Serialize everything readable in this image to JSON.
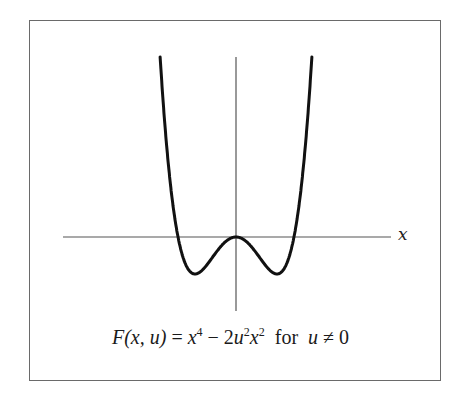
{
  "figure": {
    "axis_label_x": "x",
    "caption": {
      "lhs": "F(x, u)",
      "eq": " = ",
      "rhs_term1_base": "x",
      "rhs_term1_exp": "4",
      "minus": " − 2",
      "rhs_term2_base_u": "u",
      "rhs_term2_exp_u": "2",
      "rhs_term2_base_x": "x",
      "rhs_term2_exp_x": "2",
      "condition_word": "  for  ",
      "condition_var": "u",
      "condition_rel": " ≠ 0",
      "full_text": "F(x, u) = x⁴ − 2u²x²  for  u ≠ 0"
    },
    "colors": {
      "curve": "#111111",
      "axes": "#555555",
      "frame": "#6a6a6a",
      "background": "#ffffff"
    }
  },
  "chart_data": {
    "type": "line",
    "xlabel": "x",
    "ylabel": "",
    "function": "x^4 - 2*u^2*x^2",
    "parameter": {
      "u": 1
    },
    "features": {
      "local_max": [
        0,
        0
      ],
      "minima": [
        [
          -1,
          -1
        ],
        [
          1,
          -1
        ]
      ],
      "zeros": [
        -1.414,
        0,
        1.414
      ]
    },
    "x_range": [
      -1.85,
      1.85
    ],
    "grid": false,
    "ticks": "none"
  }
}
